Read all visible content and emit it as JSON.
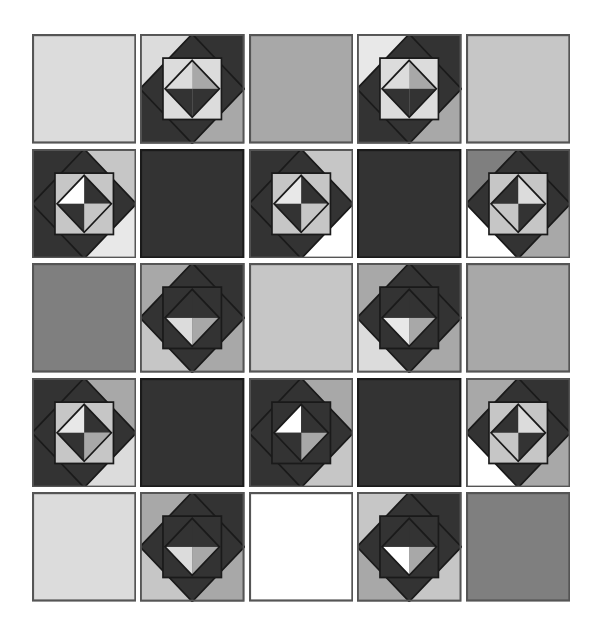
{
  "artwork": {
    "title": "Quilt Block Grid",
    "type": "geometric-pattern",
    "grid": {
      "rows": 5,
      "columns": 5,
      "tile_count": 25
    },
    "palette": {
      "white": "#ffffff",
      "very_light_gray": "#e8e8e8",
      "light_gray": "#dcdcdc",
      "mid_light_gray": "#c6c6c6",
      "mid_gray": "#a8a8a8",
      "dark_mid_gray": "#7f7f7f",
      "dark_gray": "#555555",
      "near_black": "#333333",
      "outline": "#1a1a1a",
      "background": "#ffffff"
    },
    "block_types": {
      "plain": "solid single-color square with thin dark outline",
      "pinwheel": "square-in-a-square: outer corner triangles, rotated diamond, inner upright square, inner rotated four-patch diamond"
    },
    "tiles": [
      {
        "row": 1,
        "col": 1,
        "name": "plain-light",
        "kind": "plain",
        "fill": "#dcdcdc",
        "stroke": "#555555"
      },
      {
        "row": 1,
        "col": 2,
        "name": "pinwheel-a",
        "kind": "pinwheel",
        "rotation": 0,
        "corners": [
          "#dcdcdc",
          "#333333",
          "#a8a8a8",
          "#333333"
        ],
        "diamond": "#333333",
        "inner_square": "#dcdcdc",
        "quads": [
          "#dcdcdc",
          "#a8a8a8",
          "#333333",
          "#333333"
        ],
        "stroke": "#1a1a1a"
      },
      {
        "row": 1,
        "col": 3,
        "name": "plain-mid",
        "kind": "plain",
        "fill": "#a8a8a8",
        "stroke": "#555555"
      },
      {
        "row": 1,
        "col": 4,
        "name": "pinwheel-b",
        "kind": "pinwheel",
        "rotation": 0,
        "corners": [
          "#e8e8e8",
          "#333333",
          "#a8a8a8",
          "#333333"
        ],
        "diamond": "#333333",
        "inner_square": "#dcdcdc",
        "quads": [
          "#dcdcdc",
          "#a8a8a8",
          "#333333",
          "#333333"
        ],
        "stroke": "#1a1a1a"
      },
      {
        "row": 1,
        "col": 5,
        "name": "plain-light-2",
        "kind": "plain",
        "fill": "#c6c6c6",
        "stroke": "#555555"
      },
      {
        "row": 2,
        "col": 1,
        "name": "pinwheel-c",
        "kind": "pinwheel",
        "rotation": 0,
        "corners": [
          "#333333",
          "#c6c6c6",
          "#e8e8e8",
          "#333333"
        ],
        "diamond": "#333333",
        "inner_square": "#c6c6c6",
        "quads": [
          "#ffffff",
          "#333333",
          "#c6c6c6",
          "#333333"
        ],
        "stroke": "#1a1a1a"
      },
      {
        "row": 2,
        "col": 2,
        "name": "plain-dark",
        "kind": "plain",
        "fill": "#333333",
        "stroke": "#1a1a1a"
      },
      {
        "row": 2,
        "col": 3,
        "name": "pinwheel-d",
        "kind": "pinwheel",
        "rotation": 0,
        "corners": [
          "#333333",
          "#c6c6c6",
          "#ffffff",
          "#333333"
        ],
        "diamond": "#333333",
        "inner_square": "#c6c6c6",
        "quads": [
          "#e8e8e8",
          "#333333",
          "#c6c6c6",
          "#333333"
        ],
        "stroke": "#1a1a1a"
      },
      {
        "row": 2,
        "col": 4,
        "name": "plain-dark-2",
        "kind": "plain",
        "fill": "#333333",
        "stroke": "#1a1a1a"
      },
      {
        "row": 2,
        "col": 5,
        "name": "pinwheel-e",
        "kind": "pinwheel",
        "rotation": 90,
        "corners": [
          "#333333",
          "#a8a8a8",
          "#ffffff",
          "#7f7f7f"
        ],
        "diamond": "#333333",
        "inner_square": "#c6c6c6",
        "quads": [
          "#dcdcdc",
          "#333333",
          "#c6c6c6",
          "#333333"
        ],
        "stroke": "#1a1a1a"
      },
      {
        "row": 3,
        "col": 1,
        "name": "plain-dark-mid",
        "kind": "plain",
        "fill": "#7f7f7f",
        "stroke": "#555555"
      },
      {
        "row": 3,
        "col": 2,
        "name": "pinwheel-f",
        "kind": "pinwheel",
        "rotation": 180,
        "corners": [
          "#a8a8a8",
          "#c6c6c6",
          "#a8a8a8",
          "#333333"
        ],
        "diamond": "#333333",
        "inner_square": "#333333",
        "quads": [
          "#a8a8a8",
          "#dcdcdc",
          "#333333",
          "#333333"
        ],
        "stroke": "#1a1a1a"
      },
      {
        "row": 3,
        "col": 3,
        "name": "plain-mid-2",
        "kind": "plain",
        "fill": "#c6c6c6",
        "stroke": "#555555"
      },
      {
        "row": 3,
        "col": 4,
        "name": "pinwheel-g",
        "kind": "pinwheel",
        "rotation": 180,
        "corners": [
          "#a8a8a8",
          "#dcdcdc",
          "#a8a8a8",
          "#333333"
        ],
        "diamond": "#333333",
        "inner_square": "#333333",
        "quads": [
          "#a8a8a8",
          "#e8e8e8",
          "#333333",
          "#333333"
        ],
        "stroke": "#1a1a1a"
      },
      {
        "row": 3,
        "col": 5,
        "name": "plain-mid-3",
        "kind": "plain",
        "fill": "#a8a8a8",
        "stroke": "#555555"
      },
      {
        "row": 4,
        "col": 1,
        "name": "pinwheel-h",
        "kind": "pinwheel",
        "rotation": 0,
        "corners": [
          "#333333",
          "#a8a8a8",
          "#dcdcdc",
          "#333333"
        ],
        "diamond": "#333333",
        "inner_square": "#c6c6c6",
        "quads": [
          "#e8e8e8",
          "#333333",
          "#a8a8a8",
          "#333333"
        ],
        "stroke": "#1a1a1a"
      },
      {
        "row": 4,
        "col": 2,
        "name": "plain-dark-3",
        "kind": "plain",
        "fill": "#333333",
        "stroke": "#1a1a1a"
      },
      {
        "row": 4,
        "col": 3,
        "name": "pinwheel-i",
        "kind": "pinwheel",
        "rotation": 0,
        "corners": [
          "#333333",
          "#a8a8a8",
          "#c6c6c6",
          "#333333"
        ],
        "diamond": "#333333",
        "inner_square": "#333333",
        "quads": [
          "#ffffff",
          "#333333",
          "#a8a8a8",
          "#333333"
        ],
        "stroke": "#1a1a1a"
      },
      {
        "row": 4,
        "col": 4,
        "name": "plain-dark-4",
        "kind": "plain",
        "fill": "#333333",
        "stroke": "#1a1a1a"
      },
      {
        "row": 4,
        "col": 5,
        "name": "pinwheel-j",
        "kind": "pinwheel",
        "rotation": 90,
        "corners": [
          "#333333",
          "#a8a8a8",
          "#ffffff",
          "#a8a8a8"
        ],
        "diamond": "#333333",
        "inner_square": "#c6c6c6",
        "quads": [
          "#dcdcdc",
          "#333333",
          "#c6c6c6",
          "#333333"
        ],
        "stroke": "#1a1a1a"
      },
      {
        "row": 5,
        "col": 1,
        "name": "plain-light-3",
        "kind": "plain",
        "fill": "#dcdcdc",
        "stroke": "#555555"
      },
      {
        "row": 5,
        "col": 2,
        "name": "pinwheel-k",
        "kind": "pinwheel",
        "rotation": 180,
        "corners": [
          "#a8a8a8",
          "#c6c6c6",
          "#a8a8a8",
          "#333333"
        ],
        "diamond": "#333333",
        "inner_square": "#333333",
        "quads": [
          "#a8a8a8",
          "#dcdcdc",
          "#333333",
          "#333333"
        ],
        "stroke": "#1a1a1a"
      },
      {
        "row": 5,
        "col": 3,
        "name": "plain-white",
        "kind": "plain",
        "fill": "#ffffff",
        "stroke": "#555555"
      },
      {
        "row": 5,
        "col": 4,
        "name": "pinwheel-l",
        "kind": "pinwheel",
        "rotation": 180,
        "corners": [
          "#c6c6c6",
          "#a8a8a8",
          "#c6c6c6",
          "#333333"
        ],
        "diamond": "#333333",
        "inner_square": "#333333",
        "quads": [
          "#a8a8a8",
          "#ffffff",
          "#333333",
          "#333333"
        ],
        "stroke": "#1a1a1a"
      },
      {
        "row": 5,
        "col": 5,
        "name": "plain-dark-mid-2",
        "kind": "plain",
        "fill": "#7f7f7f",
        "stroke": "#555555"
      }
    ]
  }
}
